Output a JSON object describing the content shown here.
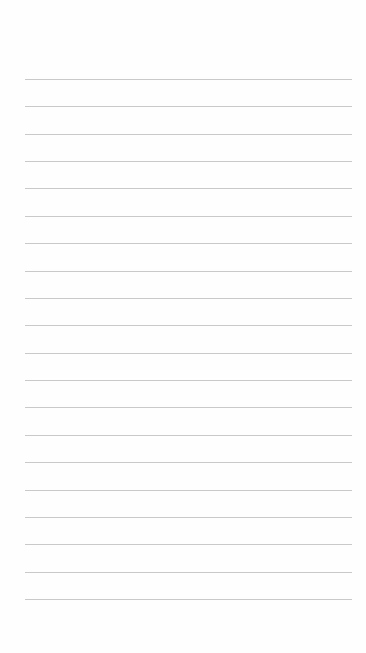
{
  "page": {
    "type": "blank lined paper",
    "background_color": "#fefefe",
    "rule_color": "#c9c9c9",
    "rule_count": 20,
    "first_rule_y": 79,
    "rule_spacing": 27.37,
    "rule_left": 25,
    "rule_right": 352
  }
}
